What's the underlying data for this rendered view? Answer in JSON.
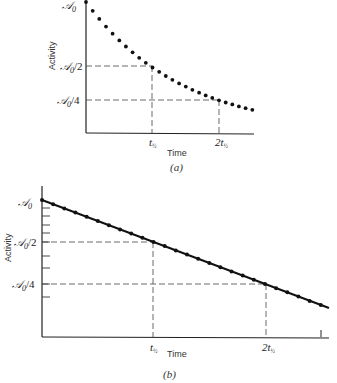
{
  "chart_data": [
    {
      "id": "a",
      "type": "scatter",
      "caption": "(a)",
      "title": "",
      "xlabel": "Time",
      "ylabel": "Activity",
      "y_scale": "linear",
      "x_ticks": [
        "t½",
        "2t½"
      ],
      "y_ticks": [
        "𝒜₀",
        "𝒜₀/2",
        "𝒜₀/4"
      ],
      "y_tick_values": [
        1.0,
        0.5,
        0.25
      ],
      "x_tick_values": [
        1,
        2
      ],
      "x_units": "half-lives",
      "description": "Exponential decay of activity; dashed guide lines drop from 𝒜₀/2 at t½ and 𝒜₀/4 at 2t½",
      "x": [
        0.0,
        0.1,
        0.2,
        0.3,
        0.4,
        0.5,
        0.6,
        0.7,
        0.8,
        0.9,
        1.0,
        1.1,
        1.2,
        1.3,
        1.4,
        1.5,
        1.6,
        1.7,
        1.8,
        1.9,
        2.0,
        2.1,
        2.2,
        2.3,
        2.4,
        2.5
      ],
      "values": [
        1.0,
        0.933,
        0.871,
        0.812,
        0.758,
        0.707,
        0.66,
        0.616,
        0.574,
        0.536,
        0.5,
        0.467,
        0.435,
        0.406,
        0.379,
        0.354,
        0.33,
        0.308,
        0.287,
        0.268,
        0.25,
        0.233,
        0.218,
        0.203,
        0.189,
        0.177
      ],
      "ylim": [
        0,
        1.0
      ],
      "xlim": [
        0,
        2.55
      ],
      "grid": false,
      "legend": null
    },
    {
      "id": "b",
      "type": "line",
      "caption": "(b)",
      "title": "",
      "xlabel": "Time",
      "ylabel": "Activity",
      "y_scale": "log",
      "x_ticks": [
        "t½",
        "2t½"
      ],
      "y_ticks": [
        "𝒜₀",
        "𝒜₀/2",
        "𝒜₀/4"
      ],
      "y_tick_values": [
        1.0,
        0.5,
        0.25
      ],
      "x_tick_values": [
        1,
        2
      ],
      "x_units": "half-lives",
      "description": "Same decay on a semilog plot — straight line with markers; dashed guide lines at 𝒜₀/2 (t½) and 𝒜₀/4 (2t½)",
      "x": [
        0.0,
        0.1,
        0.2,
        0.3,
        0.4,
        0.5,
        0.6,
        0.7,
        0.8,
        0.9,
        1.0,
        1.1,
        1.2,
        1.3,
        1.4,
        1.5,
        1.6,
        1.7,
        1.8,
        1.9,
        2.0,
        2.1,
        2.2,
        2.3,
        2.4,
        2.5
      ],
      "values": [
        1.0,
        0.933,
        0.871,
        0.812,
        0.758,
        0.707,
        0.66,
        0.616,
        0.574,
        0.536,
        0.5,
        0.467,
        0.435,
        0.406,
        0.379,
        0.354,
        0.33,
        0.308,
        0.287,
        0.268,
        0.25,
        0.233,
        0.218,
        0.203,
        0.189,
        0.177
      ],
      "xlim": [
        0,
        2.55
      ],
      "grid": false,
      "legend": null
    }
  ],
  "labels": {
    "a": {
      "y0": "𝒜",
      "y0_sub": "0",
      "y_half": "𝒜",
      "y_half_sub": "0",
      "y_half_suffix": "/2",
      "y_quarter": "𝒜",
      "y_quarter_sub": "0",
      "y_quarter_suffix": "/4",
      "t_half": "t",
      "t_half_sub": "½",
      "t2_half_prefix": "2t",
      "t2_half_sub": "½",
      "xlabel": "Time",
      "ylabel": "Activity",
      "caption": "(a)"
    },
    "b": {
      "y0": "𝒜",
      "y0_sub": "0",
      "y_half": "𝒜",
      "y_half_sub": "0",
      "y_half_suffix": "/2",
      "y_quarter": "𝒜",
      "y_quarter_sub": "0",
      "y_quarter_suffix": "/4",
      "t_half": "t",
      "t_half_sub": "½",
      "t2_half_prefix": "2t",
      "t2_half_sub": "½",
      "xlabel": "Time",
      "ylabel": "Activity",
      "caption": "(b)"
    }
  }
}
